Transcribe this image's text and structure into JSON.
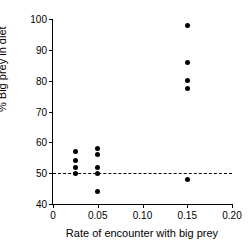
{
  "chart_data": {
    "type": "scatter",
    "title": "",
    "xlabel": "Rate of encounter with big prey",
    "ylabel": "% Big prey in diet",
    "xlim": [
      0,
      0.2
    ],
    "ylim": [
      40,
      100
    ],
    "xticks": [
      0,
      0.05,
      0.1,
      0.15,
      0.2
    ],
    "xtick_labels": [
      "0",
      "0.05",
      "0.10",
      "0.15",
      "0.20"
    ],
    "yticks": [
      40,
      50,
      60,
      70,
      80,
      90,
      100
    ],
    "ytick_labels": [
      "40",
      "50",
      "60",
      "70",
      "80",
      "90",
      "100"
    ],
    "grid": false,
    "legend": "none",
    "marker": "filled-circle",
    "marker_color": "#000000",
    "annotations": [
      {
        "name": "reference-line-50-percent",
        "type": "hline",
        "y": 50,
        "style": "dashed",
        "color": "#000000"
      }
    ],
    "points": [
      {
        "x": 0.025,
        "y": 57
      },
      {
        "x": 0.025,
        "y": 54
      },
      {
        "x": 0.025,
        "y": 52
      },
      {
        "x": 0.025,
        "y": 50
      },
      {
        "x": 0.05,
        "y": 58
      },
      {
        "x": 0.05,
        "y": 56
      },
      {
        "x": 0.05,
        "y": 52
      },
      {
        "x": 0.05,
        "y": 50
      },
      {
        "x": 0.05,
        "y": 44
      },
      {
        "x": 0.15,
        "y": 98
      },
      {
        "x": 0.15,
        "y": 86
      },
      {
        "x": 0.15,
        "y": 80
      },
      {
        "x": 0.15,
        "y": 77.5
      },
      {
        "x": 0.15,
        "y": 48
      }
    ]
  }
}
